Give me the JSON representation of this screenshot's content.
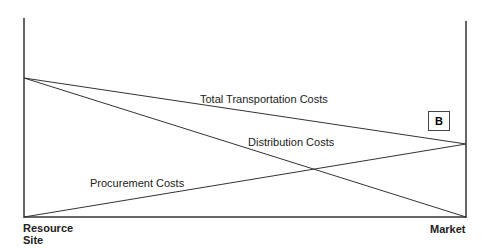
{
  "diagram": {
    "lines": {
      "total_transportation": "Total Transportation Costs",
      "distribution": "Distribution Costs",
      "procurement": "Procurement Costs"
    },
    "marker": "B",
    "axis_labels": {
      "left_line1": "Resource",
      "left_line2": "Site",
      "right": "Market"
    },
    "colors": {
      "line": "#333333",
      "background": "#ffffff"
    }
  }
}
